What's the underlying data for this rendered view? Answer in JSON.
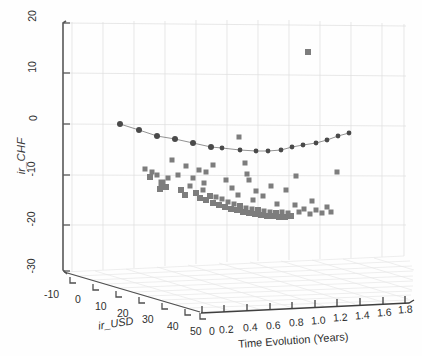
{
  "figure": {
    "kind": "3d-scatter-plot",
    "background": "#ffffff",
    "grid_color": "#dcdcdc",
    "axis_color": "#5a5a5a",
    "marker_color": "#7d7d7d",
    "line_color": "#4a4a4a"
  },
  "axes": {
    "y": {
      "label": "ir_CHF",
      "ticks": [
        "20",
        "10",
        "0",
        "-10",
        "-20",
        "-30"
      ],
      "values": [
        20,
        10,
        0,
        -10,
        -20,
        -30
      ],
      "range": [
        -30,
        20
      ]
    },
    "x": {
      "label": "ir_USD",
      "ticks": [
        "-10",
        "0",
        "10",
        "20",
        "30",
        "40",
        "50"
      ],
      "values": [
        -10,
        0,
        10,
        20,
        30,
        40,
        50
      ],
      "range": [
        -10,
        50
      ]
    },
    "z": {
      "label": "Time Evolution (Years)",
      "ticks": [
        "0",
        "0.2",
        "0.4",
        "0.6",
        "0.8",
        "1.0",
        "1.2",
        "1.4",
        "1.6",
        "1.8"
      ],
      "values": [
        0,
        0.2,
        0.4,
        0.6,
        0.8,
        1.0,
        1.2,
        1.4,
        1.6,
        1.8
      ],
      "range": [
        0,
        2.0
      ]
    }
  },
  "chart_data": {
    "type": "scatter",
    "title": "",
    "xlabel": "ir_USD",
    "ylabel": "ir_CHF",
    "zlabel": "Time Evolution (Years)",
    "xlim": [
      -10,
      50
    ],
    "ylim": [
      -30,
      20
    ],
    "zlim": [
      0,
      2.0
    ],
    "grid": true,
    "legend": "none",
    "series": [
      {
        "name": "mean-curve",
        "style": "line-with-round-markers",
        "color": "#4a4a4a",
        "points": [
          {
            "px": 120,
            "py": 124
          },
          {
            "px": 139,
            "py": 130
          },
          {
            "px": 157,
            "py": 136
          },
          {
            "px": 175,
            "py": 139
          },
          {
            "px": 193,
            "py": 143
          },
          {
            "px": 211,
            "py": 147
          },
          {
            "px": 222,
            "py": 148
          },
          {
            "px": 240,
            "py": 150
          },
          {
            "px": 256,
            "py": 151
          },
          {
            "px": 268,
            "py": 151
          },
          {
            "px": 281,
            "py": 150
          },
          {
            "px": 292,
            "py": 147
          },
          {
            "px": 303,
            "py": 145
          },
          {
            "px": 316,
            "py": 143
          },
          {
            "px": 327,
            "py": 140
          },
          {
            "px": 338,
            "py": 136
          },
          {
            "px": 349,
            "py": 133
          }
        ]
      },
      {
        "name": "scatter-cloud",
        "style": "square-markers",
        "color": "#7d7d7d",
        "points": [
          {
            "px": 308,
            "py": 52,
            "size": 6
          },
          {
            "px": 239,
            "py": 137,
            "size": 5
          },
          {
            "px": 245,
            "py": 163,
            "size": 5
          },
          {
            "px": 152,
            "py": 172,
            "size": 5
          },
          {
            "px": 150,
            "py": 177,
            "size": 6
          },
          {
            "px": 157,
            "py": 175,
            "size": 5
          },
          {
            "px": 162,
            "py": 183,
            "size": 7
          },
          {
            "px": 166,
            "py": 187,
            "size": 6
          },
          {
            "px": 160,
            "py": 189,
            "size": 6
          },
          {
            "px": 178,
            "py": 175,
            "size": 5
          },
          {
            "px": 181,
            "py": 190,
            "size": 6
          },
          {
            "px": 185,
            "py": 195,
            "size": 6
          },
          {
            "px": 190,
            "py": 186,
            "size": 5
          },
          {
            "px": 193,
            "py": 178,
            "size": 5
          },
          {
            "px": 196,
            "py": 193,
            "size": 6
          },
          {
            "px": 200,
            "py": 198,
            "size": 6
          },
          {
            "px": 203,
            "py": 190,
            "size": 5
          },
          {
            "px": 206,
            "py": 200,
            "size": 6
          },
          {
            "px": 210,
            "py": 196,
            "size": 6
          },
          {
            "px": 213,
            "py": 203,
            "size": 6
          },
          {
            "px": 216,
            "py": 197,
            "size": 5
          },
          {
            "px": 219,
            "py": 205,
            "size": 6
          },
          {
            "px": 222,
            "py": 199,
            "size": 5
          },
          {
            "px": 225,
            "py": 207,
            "size": 6
          },
          {
            "px": 228,
            "py": 202,
            "size": 5
          },
          {
            "px": 231,
            "py": 209,
            "size": 6
          },
          {
            "px": 234,
            "py": 204,
            "size": 5
          },
          {
            "px": 237,
            "py": 210,
            "size": 6
          },
          {
            "px": 240,
            "py": 206,
            "size": 6
          },
          {
            "px": 243,
            "py": 212,
            "size": 6
          },
          {
            "px": 246,
            "py": 208,
            "size": 5
          },
          {
            "px": 249,
            "py": 213,
            "size": 6
          },
          {
            "px": 252,
            "py": 209,
            "size": 5
          },
          {
            "px": 255,
            "py": 214,
            "size": 6
          },
          {
            "px": 258,
            "py": 210,
            "size": 6
          },
          {
            "px": 261,
            "py": 215,
            "size": 6
          },
          {
            "px": 264,
            "py": 211,
            "size": 5
          },
          {
            "px": 267,
            "py": 216,
            "size": 6
          },
          {
            "px": 270,
            "py": 212,
            "size": 5
          },
          {
            "px": 273,
            "py": 216,
            "size": 6
          },
          {
            "px": 276,
            "py": 213,
            "size": 6
          },
          {
            "px": 279,
            "py": 217,
            "size": 6
          },
          {
            "px": 282,
            "py": 212,
            "size": 5
          },
          {
            "px": 285,
            "py": 217,
            "size": 6
          },
          {
            "px": 288,
            "py": 213,
            "size": 5
          },
          {
            "px": 291,
            "py": 216,
            "size": 6
          },
          {
            "px": 206,
            "py": 172,
            "size": 5
          },
          {
            "px": 213,
            "py": 165,
            "size": 5
          },
          {
            "px": 226,
            "py": 180,
            "size": 5
          },
          {
            "px": 232,
            "py": 188,
            "size": 5
          },
          {
            "px": 247,
            "py": 174,
            "size": 5
          },
          {
            "px": 249,
            "py": 180,
            "size": 5
          },
          {
            "px": 256,
            "py": 191,
            "size": 5
          },
          {
            "px": 263,
            "py": 196,
            "size": 5
          },
          {
            "px": 271,
            "py": 186,
            "size": 5
          },
          {
            "px": 286,
            "py": 190,
            "size": 5
          },
          {
            "px": 295,
            "py": 205,
            "size": 5
          },
          {
            "px": 299,
            "py": 212,
            "size": 5
          },
          {
            "px": 304,
            "py": 209,
            "size": 5
          },
          {
            "px": 310,
            "py": 214,
            "size": 5
          },
          {
            "px": 316,
            "py": 210,
            "size": 5
          },
          {
            "px": 322,
            "py": 213,
            "size": 5
          },
          {
            "px": 327,
            "py": 207,
            "size": 5
          },
          {
            "px": 331,
            "py": 212,
            "size": 5
          },
          {
            "px": 296,
            "py": 176,
            "size": 5
          },
          {
            "px": 337,
            "py": 172,
            "size": 5
          },
          {
            "px": 186,
            "py": 166,
            "size": 5
          },
          {
            "px": 172,
            "py": 160,
            "size": 5
          },
          {
            "px": 145,
            "py": 169,
            "size": 5
          },
          {
            "px": 204,
            "py": 183,
            "size": 5
          },
          {
            "px": 168,
            "py": 178,
            "size": 5
          },
          {
            "px": 199,
            "py": 170,
            "size": 5
          },
          {
            "px": 238,
            "py": 195,
            "size": 5
          },
          {
            "px": 253,
            "py": 200,
            "size": 5
          },
          {
            "px": 277,
            "py": 204,
            "size": 5
          },
          {
            "px": 312,
            "py": 201,
            "size": 5
          }
        ]
      }
    ]
  }
}
